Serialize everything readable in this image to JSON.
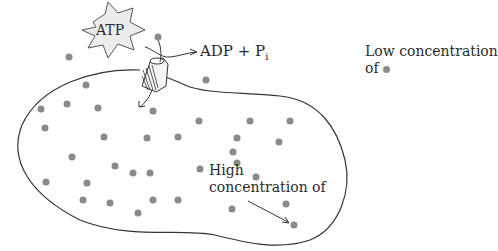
{
  "diagram": {
    "type": "active transport illustration",
    "labels": {
      "atp": "ATP",
      "products_main": "ADP + P",
      "products_sub": "i",
      "low_line1": "Low concentration",
      "low_line2": "of",
      "high_line1": "High",
      "high_line2": "concentration of"
    },
    "colors": {
      "dot": "#8a8a8a",
      "line": "#333333",
      "starburst_fill": "#ececec",
      "text": "#2a2a2a"
    },
    "outside_dots": [
      [
        69,
        57
      ],
      [
        158,
        37
      ],
      [
        206,
        80
      ]
    ],
    "inside_dots": [
      [
        41,
        109
      ],
      [
        67,
        104
      ],
      [
        86,
        85
      ],
      [
        98,
        108
      ],
      [
        153,
        111
      ],
      [
        199,
        121
      ],
      [
        45,
        128
      ],
      [
        104,
        137
      ],
      [
        72,
        157
      ],
      [
        147,
        138
      ],
      [
        178,
        137
      ],
      [
        87,
        183
      ],
      [
        115,
        166
      ],
      [
        133,
        173
      ],
      [
        150,
        173
      ],
      [
        46,
        182
      ],
      [
        83,
        200
      ],
      [
        110,
        203
      ],
      [
        138,
        213
      ],
      [
        153,
        200
      ],
      [
        178,
        200
      ],
      [
        233,
        152
      ],
      [
        250,
        121
      ],
      [
        237,
        138
      ],
      [
        279,
        142
      ],
      [
        290,
        121
      ],
      [
        237,
        163
      ],
      [
        256,
        177
      ],
      [
        232,
        209
      ],
      [
        286,
        204
      ],
      [
        294,
        225
      ],
      [
        200,
        169
      ]
    ]
  }
}
